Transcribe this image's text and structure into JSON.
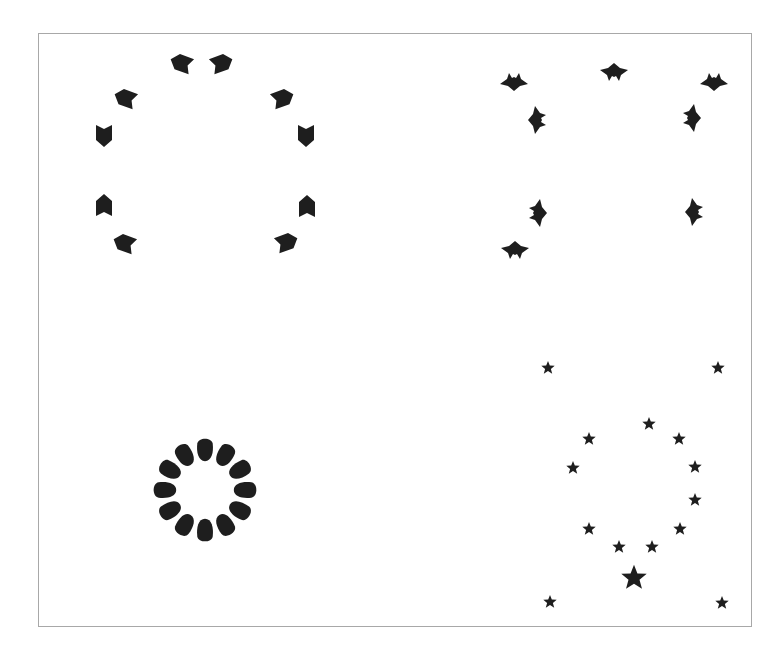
{
  "figure": {
    "frame": {
      "x": 38,
      "y": 33,
      "width": 714,
      "height": 594,
      "border_color": "#a8a8a8"
    },
    "fill_color": "#1e1e1e",
    "panels": [
      {
        "name": "top-left",
        "shape": "arrowhead",
        "count": 10,
        "items": [
          {
            "x": 181,
            "y": 63,
            "rot": -160
          },
          {
            "x": 222,
            "y": 63,
            "rot": -20
          },
          {
            "x": 125,
            "y": 98,
            "rot": -160
          },
          {
            "x": 283,
            "y": 98,
            "rot": -20
          },
          {
            "x": 104,
            "y": 136,
            "rot": 90
          },
          {
            "x": 306,
            "y": 136,
            "rot": 90
          },
          {
            "x": 104,
            "y": 205,
            "rot": -90
          },
          {
            "x": 307,
            "y": 206,
            "rot": -90
          },
          {
            "x": 124,
            "y": 243,
            "rot": 200
          },
          {
            "x": 287,
            "y": 242,
            "rot": -20
          }
        ]
      },
      {
        "name": "top-right",
        "shape": "crown",
        "count": 8,
        "items": [
          {
            "x": 514,
            "y": 82,
            "rot": 0
          },
          {
            "x": 614,
            "y": 72,
            "rot": 180
          },
          {
            "x": 714,
            "y": 82,
            "rot": 0
          },
          {
            "x": 537,
            "y": 120,
            "rot": 90
          },
          {
            "x": 692,
            "y": 118,
            "rot": -90
          },
          {
            "x": 538,
            "y": 213,
            "rot": -90
          },
          {
            "x": 694,
            "y": 212,
            "rot": 90
          },
          {
            "x": 515,
            "y": 250,
            "rot": 180
          }
        ]
      },
      {
        "name": "bottom-left",
        "shape": "petal-ring",
        "count": 12,
        "center": {
          "x": 205,
          "y": 490
        },
        "radius": 42
      },
      {
        "name": "bottom-right",
        "shape": "star",
        "count": 15,
        "items": [
          {
            "x": 548,
            "y": 368,
            "s": 1
          },
          {
            "x": 718,
            "y": 368,
            "s": 1
          },
          {
            "x": 649,
            "y": 424,
            "s": 1
          },
          {
            "x": 589,
            "y": 439,
            "s": 1
          },
          {
            "x": 679,
            "y": 439,
            "s": 1
          },
          {
            "x": 573,
            "y": 468,
            "s": 1
          },
          {
            "x": 695,
            "y": 467,
            "s": 1
          },
          {
            "x": 695,
            "y": 500,
            "s": 1
          },
          {
            "x": 589,
            "y": 529,
            "s": 1
          },
          {
            "x": 680,
            "y": 529,
            "s": 1
          },
          {
            "x": 619,
            "y": 547,
            "s": 1
          },
          {
            "x": 652,
            "y": 547,
            "s": 1
          },
          {
            "x": 634,
            "y": 578,
            "s": 1.9
          },
          {
            "x": 550,
            "y": 602,
            "s": 1
          },
          {
            "x": 722,
            "y": 603,
            "s": 1
          }
        ]
      }
    ]
  }
}
